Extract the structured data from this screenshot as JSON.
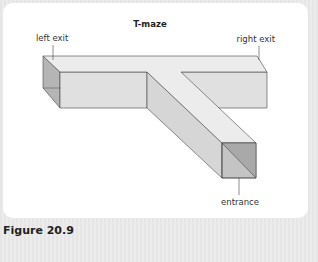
{
  "figure": {
    "title": "T-maze",
    "caption": "Figure 20.9",
    "labels": {
      "left_exit": "left exit",
      "right_exit": "right exit",
      "entrance": "entrance"
    }
  },
  "colors": {
    "background": "#e8e8e8",
    "panel": "#ffffff",
    "top_face": "#ececec",
    "front_face": "#e0e0e0",
    "side_face": "#d6d6d6",
    "dark_face": "#b5b5b5",
    "edge": "#444444"
  }
}
